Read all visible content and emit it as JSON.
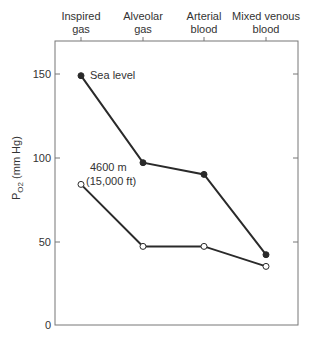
{
  "chart_data": {
    "type": "line",
    "title": "",
    "xlabel": "",
    "ylabel": "P_O2 (mm Hg)",
    "ylabel_main": "P",
    "ylabel_sub": "O2",
    "ylabel_unit": "(mm Hg)",
    "ylim": [
      0,
      170
    ],
    "yticks": [
      0,
      50,
      100,
      150
    ],
    "grid": false,
    "categories": [
      {
        "line1": "Inspired",
        "line2": "gas"
      },
      {
        "line1": "Alveolar",
        "line2": "gas"
      },
      {
        "line1": "Arterial",
        "line2": "blood"
      },
      {
        "line1": "Mixed venous",
        "line2": "blood"
      }
    ],
    "category_names": [
      "Inspired gas",
      "Alveolar gas",
      "Arterial blood",
      "Mixed venous blood"
    ],
    "series": [
      {
        "name": "Sea level",
        "label_line1": "Sea level",
        "marker": "filled-circle",
        "values": [
          149,
          97,
          90,
          42
        ]
      },
      {
        "name": "4600 m (15,000 ft)",
        "label_line1": "4600 m",
        "label_line2": "(15,000 ft)",
        "marker": "open-circle",
        "values": [
          84,
          47,
          47,
          35
        ]
      }
    ],
    "colors": {
      "line": "#2a2a2a",
      "axis": "#666666"
    }
  }
}
